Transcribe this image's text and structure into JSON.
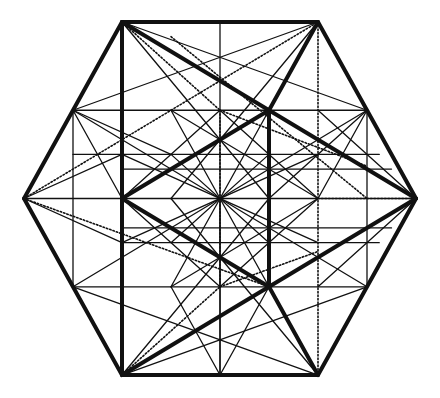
{
  "diagram": {
    "title": "",
    "stroke_color": "#111111",
    "background": "#ffffff",
    "points": {
      "A": [
        2,
        0
      ],
      "B": [
        6,
        0
      ],
      "C": [
        8,
        6
      ],
      "D": [
        6,
        12
      ],
      "E": [
        2,
        12
      ],
      "F": [
        0,
        6
      ],
      "P": [
        5,
        3
      ],
      "Q": [
        2,
        6
      ],
      "R": [
        5,
        9
      ],
      "O": [
        4,
        6
      ]
    },
    "bold_segments": [
      [
        "A",
        "B"
      ],
      [
        "B",
        "C"
      ],
      [
        "C",
        "D"
      ],
      [
        "D",
        "E"
      ],
      [
        "E",
        "F"
      ],
      [
        "F",
        "A"
      ],
      [
        [
          2,
          0
        ],
        [
          2,
          12
        ]
      ],
      [
        "A",
        "C"
      ],
      [
        "B",
        "P"
      ],
      [
        "Q",
        "P"
      ],
      [
        "P",
        "R"
      ],
      [
        "Q",
        "R"
      ],
      [
        "R",
        "C"
      ],
      [
        "R",
        "D"
      ],
      [
        "E",
        "R"
      ]
    ],
    "thin_segments": [
      [
        [
          1,
          3
        ],
        [
          7,
          3
        ]
      ],
      [
        [
          1,
          4.5
        ],
        [
          7.25,
          4.5
        ]
      ],
      [
        [
          2,
          5
        ],
        [
          7.5,
          5
        ]
      ],
      [
        [
          0,
          6
        ],
        [
          8,
          6
        ]
      ],
      [
        [
          2,
          7
        ],
        [
          7.5,
          7
        ]
      ],
      [
        [
          2,
          7.5
        ],
        [
          7.25,
          7.5
        ]
      ],
      [
        [
          1,
          9
        ],
        [
          7,
          9
        ]
      ],
      [
        [
          1,
          3
        ],
        [
          1,
          9
        ]
      ],
      [
        [
          4,
          0
        ],
        [
          4,
          12
        ]
      ],
      [
        [
          7,
          3
        ],
        [
          7,
          9
        ]
      ],
      [
        [
          6,
          0
        ],
        [
          1,
          3
        ]
      ],
      [
        [
          2,
          0
        ],
        [
          7,
          3
        ]
      ],
      [
        [
          6,
          0
        ],
        [
          3,
          6
        ]
      ],
      [
        [
          2,
          0
        ],
        [
          5,
          6
        ]
      ],
      [
        [
          1,
          3
        ],
        [
          4,
          6
        ]
      ],
      [
        [
          1,
          3
        ],
        [
          2,
          6
        ]
      ],
      [
        [
          1,
          3
        ],
        [
          3,
          4.5
        ]
      ],
      [
        [
          7,
          3
        ],
        [
          4,
          6
        ]
      ],
      [
        [
          7,
          3
        ],
        [
          5,
          6
        ]
      ],
      [
        [
          7,
          3
        ],
        [
          6,
          6
        ]
      ],
      [
        [
          1,
          9
        ],
        [
          4,
          6
        ]
      ],
      [
        [
          1,
          9
        ],
        [
          6,
          12
        ]
      ],
      [
        [
          7,
          9
        ],
        [
          4,
          6
        ]
      ],
      [
        [
          7,
          9
        ],
        [
          2,
          12
        ]
      ],
      [
        [
          3,
          6
        ],
        [
          6,
          12
        ]
      ],
      [
        [
          5,
          6
        ],
        [
          2,
          12
        ]
      ],
      [
        [
          4,
          6
        ],
        [
          4,
          12
        ]
      ],
      [
        [
          4,
          12
        ],
        [
          3,
          9
        ]
      ],
      [
        [
          4,
          12
        ],
        [
          5,
          9
        ]
      ],
      [
        [
          3,
          3
        ],
        [
          5,
          9
        ]
      ],
      [
        [
          5,
          3
        ],
        [
          3,
          9
        ]
      ],
      [
        [
          3,
          3
        ],
        [
          6,
          6
        ]
      ],
      [
        [
          3,
          9
        ],
        [
          6,
          6
        ]
      ],
      [
        [
          2,
          6
        ],
        [
          5,
          9
        ]
      ],
      [
        [
          4,
          3
        ],
        [
          2,
          6
        ]
      ],
      [
        [
          4,
          3
        ],
        [
          6,
          6
        ]
      ],
      [
        [
          4,
          9
        ],
        [
          2,
          6
        ]
      ],
      [
        [
          4,
          9
        ],
        [
          6,
          6
        ]
      ],
      [
        [
          3,
          4.5
        ],
        [
          5,
          7.5
        ]
      ],
      [
        [
          3,
          7.5
        ],
        [
          5,
          4.5
        ]
      ],
      [
        [
          2,
          4.5
        ],
        [
          6,
          7.5
        ]
      ],
      [
        [
          2,
          7.5
        ],
        [
          6,
          4.5
        ]
      ],
      [
        [
          0,
          6
        ],
        [
          2,
          4.5
        ]
      ],
      [
        [
          0,
          6
        ],
        [
          2,
          7.5
        ]
      ],
      [
        [
          6,
          9
        ],
        [
          8,
          6
        ]
      ],
      [
        [
          6,
          3
        ],
        [
          8,
          6
        ]
      ]
    ],
    "dotted_segments": [
      [
        [
          0,
          6
        ],
        [
          6,
          0
        ]
      ],
      [
        [
          2,
          0
        ],
        [
          4,
          3
        ]
      ],
      [
        [
          4,
          3
        ],
        [
          4,
          9
        ]
      ],
      [
        [
          3,
          0.5
        ],
        [
          7,
          6
        ]
      ],
      [
        [
          0,
          6
        ],
        [
          5,
          9
        ]
      ],
      [
        [
          2,
          12
        ],
        [
          4,
          9
        ]
      ],
      [
        [
          6,
          0
        ],
        [
          6,
          12
        ]
      ],
      [
        [
          6,
          6
        ],
        [
          8,
          6
        ]
      ],
      [
        [
          4,
          3
        ],
        [
          7,
          4.9
        ]
      ],
      [
        [
          4,
          9
        ],
        [
          6,
          7.8
        ]
      ],
      [
        [
          5,
          9
        ],
        [
          6,
          12
        ]
      ]
    ]
  }
}
